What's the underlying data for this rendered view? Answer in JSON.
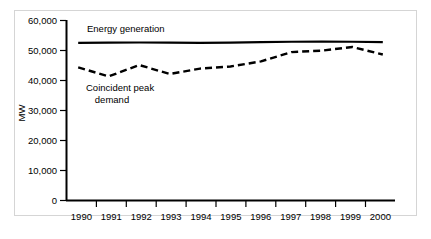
{
  "chart_data": {
    "type": "line",
    "title": "",
    "xlabel": "",
    "ylabel": "MW",
    "x": [
      1990,
      1991,
      1992,
      1993,
      1994,
      1995,
      1996,
      1997,
      1998,
      1999,
      2000
    ],
    "categories": [
      "1990",
      "1991",
      "1992",
      "1993",
      "1994",
      "1995",
      "1996",
      "1997",
      "1998",
      "1999",
      "2000"
    ],
    "xlim": [
      1989.6,
      2000.4
    ],
    "ylim": [
      0,
      60000
    ],
    "yticks": [
      0,
      10000,
      20000,
      30000,
      40000,
      50000,
      60000
    ],
    "ytick_labels": [
      "0",
      "10,000",
      "20,000",
      "30,000",
      "40,000",
      "50,000",
      "60,000"
    ],
    "grid": false,
    "legend_position": "inline-annotation",
    "series": [
      {
        "name": "Energy generation",
        "style": "solid",
        "color": "#000000",
        "values": [
          52400,
          52450,
          52500,
          52450,
          52400,
          52450,
          52600,
          52750,
          52800,
          52750,
          52600
        ]
      },
      {
        "name": "Coincident peak demand",
        "style": "dashed",
        "color": "#000000",
        "values": [
          44200,
          41200,
          45000,
          42000,
          43800,
          44500,
          46200,
          49300,
          49800,
          51000,
          48500
        ]
      }
    ],
    "annotations": [
      {
        "text": "Energy generation",
        "x": 1990.45,
        "y": 55200
      },
      {
        "text": "Coincident peak",
        "x": 1991.55,
        "y": 38300
      },
      {
        "text": "demand",
        "x": 1991.55,
        "y": 35400
      }
    ]
  },
  "axes": {
    "y_axis_title": "MW"
  }
}
